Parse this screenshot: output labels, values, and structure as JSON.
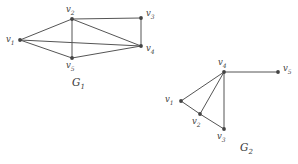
{
  "figure": {
    "background_color": "#ffffff",
    "edge_color": "#555555",
    "vertex_color": "#444444",
    "text_color": "#3a3a3a",
    "graphs": [
      {
        "name": "G1",
        "caption": "G",
        "caption_sub": "1",
        "caption_x": 72,
        "caption_y": 77,
        "vertices": [
          {
            "id": "v1",
            "label": "v",
            "sub": "1",
            "x": 20,
            "y": 40,
            "label_x": 6,
            "label_y": 35
          },
          {
            "id": "v2",
            "label": "v",
            "sub": "2",
            "x": 72,
            "y": 19,
            "label_x": 66,
            "label_y": 5
          },
          {
            "id": "v3",
            "label": "v",
            "sub": "3",
            "x": 141,
            "y": 18,
            "label_x": 146,
            "label_y": 9
          },
          {
            "id": "v4",
            "label": "v",
            "sub": "4",
            "x": 141,
            "y": 46,
            "label_x": 146,
            "label_y": 44
          },
          {
            "id": "v5",
            "label": "v",
            "sub": "5",
            "x": 72,
            "y": 58,
            "label_x": 66,
            "label_y": 61
          }
        ],
        "edges": [
          [
            "v1",
            "v2"
          ],
          [
            "v1",
            "v4"
          ],
          [
            "v1",
            "v5"
          ],
          [
            "v2",
            "v3"
          ],
          [
            "v2",
            "v4"
          ],
          [
            "v2",
            "v5"
          ],
          [
            "v3",
            "v4"
          ],
          [
            "v4",
            "v5"
          ]
        ]
      },
      {
        "name": "G2",
        "caption": "G",
        "caption_sub": "2",
        "caption_x": 240,
        "caption_y": 142,
        "vertices": [
          {
            "id": "v1",
            "label": "v",
            "sub": "1",
            "x": 181,
            "y": 101,
            "label_x": 165,
            "label_y": 95
          },
          {
            "id": "v2",
            "label": "v",
            "sub": "2",
            "x": 200,
            "y": 114,
            "label_x": 192,
            "label_y": 117
          },
          {
            "id": "v3",
            "label": "v",
            "sub": "3",
            "x": 224,
            "y": 129,
            "label_x": 217,
            "label_y": 132
          },
          {
            "id": "v4",
            "label": "v",
            "sub": "4",
            "x": 224,
            "y": 72,
            "label_x": 218,
            "label_y": 58
          },
          {
            "id": "v5",
            "label": "v",
            "sub": "5",
            "x": 278,
            "y": 72,
            "label_x": 283,
            "label_y": 64
          }
        ],
        "edges": [
          [
            "v4",
            "v1"
          ],
          [
            "v4",
            "v2"
          ],
          [
            "v4",
            "v3"
          ],
          [
            "v4",
            "v5"
          ],
          [
            "v1",
            "v2"
          ],
          [
            "v2",
            "v3"
          ]
        ]
      }
    ]
  }
}
